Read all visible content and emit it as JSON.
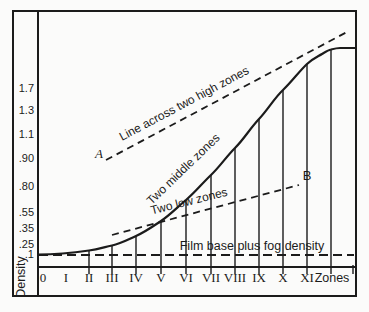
{
  "y_axis": {
    "title": "Density",
    "tick_labels": [
      "1.7",
      "1.3",
      "1.1",
      ".90",
      ".80",
      ".55",
      ".35",
      ".25",
      ".1"
    ]
  },
  "x_axis": {
    "title": "Zones",
    "tick_labels": [
      "0",
      "I",
      "II",
      "III",
      "IV",
      "V",
      "VI",
      "VII",
      "VIII",
      "IX",
      "X",
      "XI"
    ]
  },
  "annotations": {
    "high_zones_line": "Line across two high zones",
    "middle_zones": "Two middle zones",
    "low_zones_line": "Two low zones",
    "film_base": "Film base plus fog density",
    "point_a": "A",
    "point_b": "B"
  },
  "chart_data": {
    "type": "line",
    "title": "",
    "xlabel": "Zones",
    "ylabel": "Density",
    "x_tick_labels": [
      "0",
      "I",
      "II",
      "III",
      "IV",
      "V",
      "VI",
      "VII",
      "VIII",
      "IX",
      "X",
      "XI"
    ],
    "y_tick_labels": [
      ".1",
      ".25",
      ".35",
      ".55",
      ".80",
      ".90",
      "1.1",
      "1.3",
      "1.7"
    ],
    "grid": false,
    "legend_position": "none",
    "series": [
      {
        "name": "Characteristic curve",
        "style": "solid",
        "x_zones": [
          "0",
          "I",
          "II",
          "III",
          "IV",
          "V",
          "VI",
          "VII",
          "VIII",
          "IX",
          "X",
          "XI",
          "shoulder"
        ],
        "density_estimates": [
          0.1,
          0.11,
          0.13,
          0.2,
          0.3,
          0.45,
          0.65,
          0.85,
          1.0,
          1.2,
          1.45,
          1.65,
          1.75
        ]
      },
      {
        "name": "Line across two high zones",
        "style": "dashed",
        "endpoint_label": "A",
        "spans_zones": [
          "III",
          "XI"
        ]
      },
      {
        "name": "Two low zones",
        "style": "dashed",
        "endpoint_label": "B",
        "spans_zones": [
          "III",
          "X"
        ]
      },
      {
        "name": "Film base plus fog density",
        "style": "dashed",
        "density": 0.1
      }
    ]
  },
  "geometry": {
    "stroke_color": "#1b1b1b",
    "outer": {
      "x": 13,
      "y": 11,
      "w": 343,
      "h": 285
    },
    "y_divider_x": 38,
    "x_axis_y": 267,
    "plot_right": 356,
    "film_base_y": 255,
    "vertical_bottom": 274,
    "extra_tick_x": 353,
    "verticals": [
      {
        "x": 89,
        "top": 250.5
      },
      {
        "x": 112,
        "top": 245.5
      },
      {
        "x": 136,
        "top": 236
      },
      {
        "x": 161,
        "top": 221
      },
      {
        "x": 186,
        "top": 200
      },
      {
        "x": 211,
        "top": 175
      },
      {
        "x": 235,
        "top": 148
      },
      {
        "x": 259,
        "top": 119
      },
      {
        "x": 283,
        "top": 90
      },
      {
        "x": 307,
        "top": 64
      },
      {
        "x": 331,
        "top": 49.5
      }
    ],
    "curve_path": "M38 254.5 C54 254.5 72 253 89 250.5 C98 249.2 103 247.5 112 245.5 C121 243.5 127 240 136 236 C145 232 152 227 161 221 C170 215 177 207.5 186 200 C195 192.5 202 183.5 211 175 C220 166.5 226 157 235 148 C244 139 250 128.5 259 119 C268 109.5 274 98.5 283 90 C292 81.5 299 71.5 307 64 C313 58.5 317 57 322 54 C327 51 328.5 50 331 49.5 C334.5 48.6 337 48 340 48 L356 48",
    "high_line": {
      "x1": 106,
      "y1": 160,
      "x2": 347,
      "y2": 32,
      "dash": "7 5"
    },
    "low_line": {
      "x1": 112,
      "y1": 235,
      "x2": 299,
      "y2": 185,
      "dash": "7 5"
    },
    "film_dash": "9 5"
  }
}
